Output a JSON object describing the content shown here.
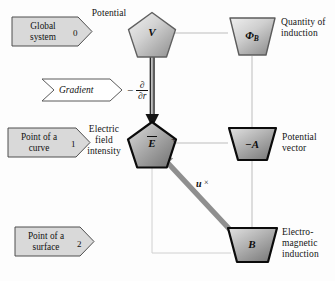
{
  "diagram": {
    "banners": [
      {
        "id": "global-system",
        "line1": "Global",
        "line2": "system",
        "index": "0"
      },
      {
        "id": "point-of-a-curve",
        "line1": "Point of a",
        "line2": "curve",
        "index": "1"
      },
      {
        "id": "point-of-a-surface",
        "line1": "Point of a",
        "line2": "surface",
        "index": "2"
      }
    ],
    "operator_banner": {
      "id": "gradient",
      "label": "Gradient",
      "minus": "−",
      "numerator": "∂",
      "denominator": "∂r"
    },
    "nodes": [
      {
        "id": "potential",
        "symbol": "V",
        "subscript": "",
        "shape": "pentagon",
        "label": "Potential",
        "label_position": "above-left"
      },
      {
        "id": "quantity-of-induction",
        "symbol": "Φ",
        "subscript": "B",
        "shape": "trapezoid",
        "label": "Quantity of\ninduction",
        "label_position": "right"
      },
      {
        "id": "electric-field-intensity",
        "symbol": "E",
        "subscript": "",
        "shape": "pentagon",
        "label": "Electric\nfield\nintensity",
        "label_position": "left",
        "overbar": true
      },
      {
        "id": "potential-vector",
        "symbol": "−A",
        "subscript": "",
        "shape": "trapezoid",
        "label": "Potential\nvector",
        "label_position": "right"
      },
      {
        "id": "electromagnetic-induction",
        "symbol": "B",
        "subscript": "",
        "shape": "trapezoid",
        "label": "Electro-\nmagnetic\ninduction",
        "label_position": "right"
      }
    ],
    "edges": [
      {
        "id": "v-to-phib",
        "from": "potential",
        "to": "quantity-of-induction",
        "style": "thin-gray",
        "label": ""
      },
      {
        "id": "v-to-e",
        "from": "potential",
        "to": "electric-field-intensity",
        "style": "thick-arrow",
        "label": "gradient"
      },
      {
        "id": "phib-to-a",
        "from": "quantity-of-induction",
        "to": "potential-vector",
        "style": "thin-gray",
        "label": ""
      },
      {
        "id": "a-to-e",
        "from": "potential-vector",
        "to": "electric-field-intensity",
        "style": "thin-gray",
        "label": "+"
      },
      {
        "id": "a-to-b",
        "from": "potential-vector",
        "to": "electromagnetic-induction",
        "style": "thin-gray",
        "label": ""
      },
      {
        "id": "b-to-e-thin",
        "from": "electromagnetic-induction",
        "to": "electric-field-intensity",
        "style": "thin-gray",
        "label": ""
      },
      {
        "id": "b-to-e-arrow",
        "from": "electromagnetic-induction",
        "to": "electric-field-intensity",
        "style": "thick-gray-arrow",
        "label": "u ×"
      }
    ],
    "plus_label": "+",
    "cross_label": {
      "vector": "u",
      "operator": "×"
    },
    "colors": {
      "banner_fill": "#d9d9d9",
      "banner_stroke": "#4a4a4a",
      "node_fill_light": "#e6e6e6",
      "node_fill_dark": "#9a9a9a",
      "node_stroke_light": "#595959",
      "node_stroke_dark": "#0b0b0b",
      "connector": "#b9b9b9",
      "thick_arrow": "#1a1a1a",
      "gray_arrow": "#8f8f8f",
      "background": "#fdfdfd",
      "text": "#141414"
    }
  }
}
